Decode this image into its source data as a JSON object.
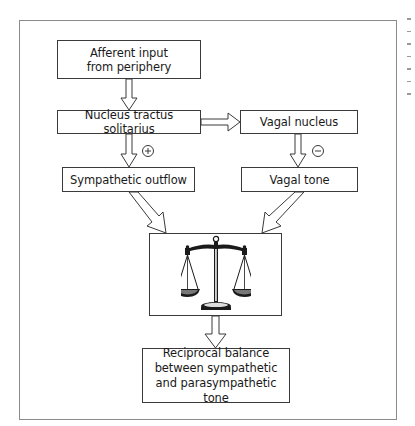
{
  "diagram": {
    "nodes": {
      "afferent": {
        "lines": [
          "Afferent input",
          "from periphery"
        ]
      },
      "nts": {
        "label": "Nucleus tractus solitarius"
      },
      "vagal_nucleus": {
        "label": "Vagal nucleus"
      },
      "sympathetic": {
        "label": "Sympathetic outflow"
      },
      "vagal_tone": {
        "label": "Vagal tone"
      },
      "balance_icon": {
        "icon": "scales-of-justice-icon"
      },
      "result": {
        "lines": [
          "Reciprocal balance",
          "between sympathetic",
          "and parasympathetic tone"
        ]
      }
    },
    "edge_signs": {
      "nts_to_sympathetic": "+",
      "vagal_nucleus_to_vagal_tone": "−"
    },
    "edges": [
      {
        "from": "afferent",
        "to": "nts"
      },
      {
        "from": "nts",
        "to": "vagal_nucleus"
      },
      {
        "from": "nts",
        "to": "sympathetic",
        "sign": "+"
      },
      {
        "from": "vagal_nucleus",
        "to": "vagal_tone",
        "sign": "−"
      },
      {
        "from": "sympathetic",
        "to": "balance_icon"
      },
      {
        "from": "vagal_tone",
        "to": "balance_icon"
      },
      {
        "from": "balance_icon",
        "to": "result"
      }
    ],
    "colors": {
      "line": "#3a3a3a",
      "frame": "#8a8a8a",
      "background": "#ffffff"
    }
  }
}
